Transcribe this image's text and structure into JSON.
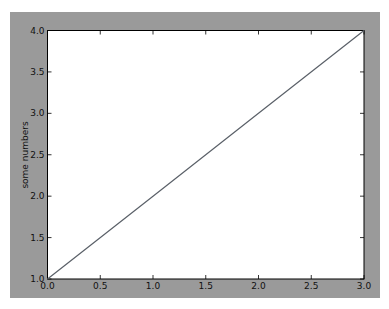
{
  "chart_data": {
    "type": "line",
    "title": "",
    "xlabel": "",
    "ylabel": "some numbers",
    "x": [
      0,
      1,
      2,
      3
    ],
    "series": [
      {
        "name": "line",
        "values": [
          1,
          2,
          3,
          4
        ],
        "color": "#5a6068"
      }
    ],
    "xlim": [
      0.0,
      3.0
    ],
    "ylim": [
      1.0,
      4.0
    ],
    "xticks": [
      "0.0",
      "0.5",
      "1.0",
      "1.5",
      "2.0",
      "2.5",
      "3.0"
    ],
    "yticks": [
      "1.0",
      "1.5",
      "2.0",
      "2.5",
      "3.0",
      "3.5",
      "4.0"
    ],
    "grid": false,
    "legend": null
  },
  "colors": {
    "figure_background": "#9a9a9a",
    "axes_background": "#ffffff",
    "line": "#5a6068"
  }
}
